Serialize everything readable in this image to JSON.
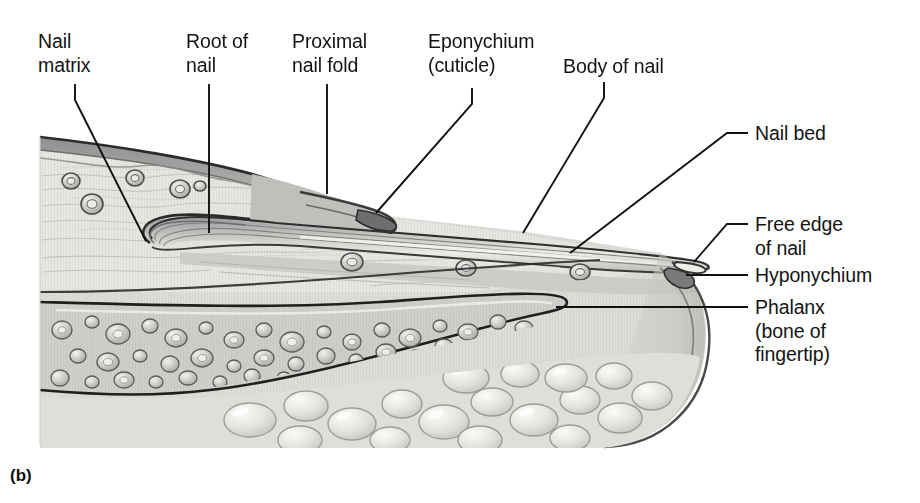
{
  "figure": {
    "caption": "(b)",
    "style": "grayscale medical illustration"
  },
  "colors": {
    "background": "#ffffff",
    "text": "#141414",
    "leader_line": "#111111",
    "outline_dark": "#2e2e2e",
    "epidermis_band": "#9a9a9a",
    "dermis_fill": "#d8d8d4",
    "nail_plate": "#8e8e8e",
    "nail_plate_light": "#efefea",
    "bone_fill": "#dededa",
    "fat_fill": "#d2d2ce",
    "vessel_fill": "#b4b4b0"
  },
  "labels": [
    {
      "id": "nail-matrix",
      "text": "Nail\nmatrix",
      "x": 38,
      "y": 30,
      "leader": "polyline",
      "points": "75,84 75,100 146,241"
    },
    {
      "id": "root-of-nail",
      "text": "Root of\nnail",
      "x": 186,
      "y": 30,
      "leader": "polyline",
      "points": "209,84 209,233"
    },
    {
      "id": "proximal-nail-fold",
      "text": "Proximal\nnail fold",
      "x": 292,
      "y": 30,
      "leader": "polyline",
      "points": "327,84 327,194"
    },
    {
      "id": "eponychium-cuticle",
      "text": "Eponychium\n(cuticle)",
      "x": 428,
      "y": 30,
      "leader": "polyline",
      "points": "472,88 472,104 376,213"
    },
    {
      "id": "body-of-nail",
      "text": "Body of nail",
      "x": 563,
      "y": 55,
      "leader": "polyline",
      "points": "604,82 604,98 523,233"
    },
    {
      "id": "nail-bed",
      "text": "Nail bed",
      "x": 755,
      "y": 122,
      "leader": "polyline",
      "points": "748,133 727,133 570,253"
    },
    {
      "id": "free-edge-of-nail",
      "text": "Free edge\nof nail",
      "x": 755,
      "y": 213,
      "leader": "polyline",
      "points": "748,224 727,224 694,262"
    },
    {
      "id": "hyponychium",
      "text": "Hyponychium",
      "x": 755,
      "y": 264,
      "leader": "polyline",
      "points": "748,275 686,275"
    },
    {
      "id": "phalanx",
      "text": "Phalanx\n(bone of\nfingertip)",
      "x": 755,
      "y": 296,
      "leader": "polyline",
      "points": "748,307 556,307"
    }
  ],
  "structures": [
    "epidermis",
    "dermis",
    "proximal nail fold",
    "nail root",
    "nail matrix",
    "nail plate / body of nail",
    "nail bed",
    "eponychium",
    "hyponychium",
    "free edge",
    "distal phalanx bone",
    "subcutaneous fat"
  ]
}
